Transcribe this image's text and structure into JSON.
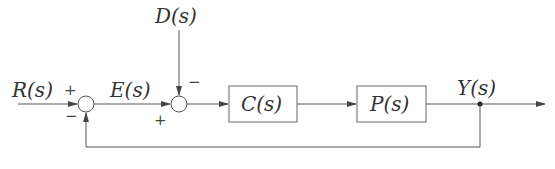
{
  "diagram": {
    "type": "feedback-control-block-diagram",
    "signals": {
      "reference": "R(s)",
      "error": "E(s)",
      "disturbance": "D(s)",
      "output": "Y(s)"
    },
    "blocks": [
      {
        "id": "controller",
        "label": "C(s)"
      },
      {
        "id": "plant",
        "label": "P(s)"
      }
    ],
    "junctions": [
      {
        "id": "sum1",
        "inputs": [
          {
            "signal": "R(s)",
            "sign": "+"
          },
          {
            "signal": "feedback Y(s)",
            "sign": "−"
          }
        ],
        "output": "E(s)"
      },
      {
        "id": "sum2",
        "inputs": [
          {
            "signal": "E(s)",
            "sign": "+"
          },
          {
            "signal": "D(s)",
            "sign": "−"
          }
        ],
        "output": "to C(s)"
      }
    ],
    "signs": {
      "sum1_top": "+",
      "sum1_bottom": "−",
      "sum2_top": "−",
      "sum2_bottom": "+"
    },
    "edges": [
      {
        "from": "R(s)",
        "to": "sum1"
      },
      {
        "from": "sum1",
        "to": "sum2",
        "label": "E(s)"
      },
      {
        "from": "D(s)",
        "to": "sum2"
      },
      {
        "from": "sum2",
        "to": "C(s)"
      },
      {
        "from": "C(s)",
        "to": "P(s)"
      },
      {
        "from": "P(s)",
        "to": "Y(s)"
      },
      {
        "from": "Y(s)",
        "to": "sum1",
        "kind": "feedback"
      }
    ]
  }
}
